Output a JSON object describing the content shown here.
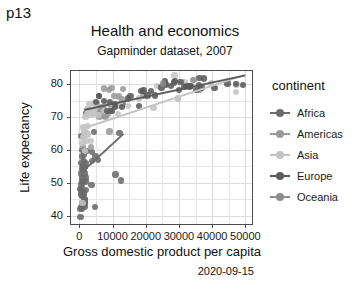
{
  "page": {
    "tag": "p13"
  },
  "chart_data": {
    "type": "scatter",
    "title": "Health and economics",
    "subtitle": "Gapminder dataset, 2007",
    "caption": "2020-09-15",
    "xlabel": "Gross domestic product per capita",
    "ylabel": "Life expectancy",
    "xlim": [
      -2500,
      52000
    ],
    "ylim": [
      37.5,
      84
    ],
    "xticks": [
      "0",
      "10000",
      "20000",
      "30000",
      "40000",
      "50000"
    ],
    "xtick_values": [
      0,
      10000,
      20000,
      30000,
      40000,
      50000
    ],
    "yticks": [
      "40",
      "50",
      "60",
      "70",
      "80"
    ],
    "ytick_values": [
      40,
      50,
      60,
      70,
      80
    ],
    "grid": true,
    "legend": {
      "title": "continent",
      "position": "right",
      "entries": [
        {
          "label": "Africa",
          "color": "#6b6b6b"
        },
        {
          "label": "Americas",
          "color": "#9a9a9a"
        },
        {
          "label": "Asia",
          "color": "#c4c4c4"
        },
        {
          "label": "Europe",
          "color": "#5a5a5a"
        },
        {
          "label": "Oceania",
          "color": "#8c8c8c"
        }
      ]
    },
    "series": [
      {
        "name": "Africa",
        "color": "#6b6b6b",
        "trendline": {
          "x1": 600,
          "y1": 53.0,
          "x2": 13500,
          "y2": 65.0
        },
        "points": [
          [
            974,
            43.8
          ],
          [
            5937,
            76.4
          ],
          [
            6223,
            72.3
          ],
          [
            4797,
            42.7
          ],
          [
            1441,
            56.7
          ],
          [
            12570,
            50.7
          ],
          [
            1217,
            50.7
          ],
          [
            430,
            52.9
          ],
          [
            2042,
            50.4
          ],
          [
            706,
            49.6
          ],
          [
            1704,
            44.7
          ],
          [
            986,
            50.4
          ],
          [
            277,
            48.2
          ],
          [
            3632,
            49.3
          ],
          [
            1544,
            54.8
          ],
          [
            2082,
            71.3
          ],
          [
            2013,
            51.6
          ],
          [
            863,
            58.0
          ],
          [
            1598,
            52.9
          ],
          [
            1932,
            56.0
          ],
          [
            1441,
            46.9
          ],
          [
            3822,
            59.4
          ],
          [
            1327,
            58.6
          ],
          [
            942,
            60.0
          ],
          [
            579,
            56.0
          ],
          [
            1463,
            46.5
          ],
          [
            1569,
            42.6
          ],
          [
            414,
            39.6
          ],
          [
            12154,
            65.2
          ],
          [
            641,
            64.2
          ],
          [
            690,
            47.0
          ],
          [
            13206,
            73.9
          ],
          [
            752,
            42.1
          ],
          [
            926,
            42.6
          ],
          [
            4513,
            65.5
          ],
          [
            1271,
            54.1
          ],
          [
            469,
            42.6
          ],
          [
            823,
            51.5
          ],
          [
            4910,
            58.0
          ],
          [
            823,
            54.4
          ],
          [
            1569,
            43.5
          ],
          [
            1302,
            55.3
          ],
          [
            574,
            46.4
          ],
          [
            619,
            48.3
          ],
          [
            2280,
            59.6
          ],
          [
            5581,
            57.0
          ],
          [
            1107,
            47.5
          ],
          [
            10957,
            52.6
          ],
          [
            3820,
            56.7
          ],
          [
            1593,
            54.8
          ],
          [
            320,
            42.1
          ],
          [
            863,
            46.0
          ],
          [
            1598,
            45.0
          ],
          [
            2042,
            47.8
          ],
          [
            1544,
            44.0
          ]
        ]
      },
      {
        "name": "Americas",
        "color": "#9a9a9a",
        "trendline": null,
        "points": [
          [
            12779,
            75.3
          ],
          [
            9066,
            65.6
          ],
          [
            9646,
            72.4
          ],
          [
            13172,
            78.6
          ],
          [
            7007,
            72.9
          ],
          [
            9645,
            78.8
          ],
          [
            8948,
            78.3
          ],
          [
            6873,
            72.9
          ],
          [
            5728,
            71.0
          ],
          [
            5186,
            74.2
          ],
          [
            7320,
            70.3
          ],
          [
            3548,
            60.9
          ],
          [
            7914,
            70.2
          ],
          [
            7093,
            72.6
          ],
          [
            1045,
            60.9
          ],
          [
            6025,
            70.2
          ],
          [
            6873,
            72.0
          ],
          [
            11978,
            76.2
          ],
          [
            9809,
            71.8
          ],
          [
            4172,
            71.7
          ],
          [
            7408,
            78.7
          ],
          [
            7320,
            72.4
          ],
          [
            19329,
            76.4
          ],
          [
            36319,
            78.2
          ],
          [
            10611,
            76.4
          ],
          [
            11416,
            73.3
          ],
          [
            8948,
            74.0
          ],
          [
            8458,
            71.0
          ]
        ]
      },
      {
        "name": "Asia",
        "color": "#c4c4c4",
        "trendline": {
          "x1": 400,
          "y1": 66.5,
          "x2": 50000,
          "y2": 83.0
        },
        "points": [
          [
            974,
            43.8
          ],
          [
            29796,
            75.6
          ],
          [
            1391,
            64.1
          ],
          [
            1713,
            59.7
          ],
          [
            1857,
            70.0
          ],
          [
            3548,
            72.0
          ],
          [
            29796,
            75.6
          ],
          [
            47143,
            77.6
          ],
          [
            4959,
            72.9
          ],
          [
            1091,
            66.8
          ],
          [
            2452,
            71.0
          ],
          [
            3540,
            62.7
          ],
          [
            11606,
            71.0
          ],
          [
            4471,
            70.9
          ],
          [
            1593,
            65.5
          ],
          [
            2280,
            72.5
          ],
          [
            28718,
            82.6
          ],
          [
            22316,
            72.8
          ],
          [
            2280,
            62.7
          ],
          [
            8458,
            74.2
          ],
          [
            12451,
            73.4
          ],
          [
            2441,
            67.3
          ],
          [
            1091,
            63.8
          ],
          [
            3540,
            70.7
          ],
          [
            23348,
            79.4
          ],
          [
            4519,
            74.2
          ],
          [
            31656,
            80.7
          ],
          [
            12154,
            73.9
          ],
          [
            39725,
            80.2
          ],
          [
            47307,
            79.9
          ],
          [
            2082,
            65.5
          ],
          [
            5728,
            70.6
          ],
          [
            3095,
            74.0
          ],
          [
            944,
            62.1
          ],
          [
            4172,
            71.7
          ],
          [
            18008,
            75.6
          ],
          [
            7458,
            71.8
          ],
          [
            2605,
            72.2
          ],
          [
            14641,
            73.4
          ],
          [
            2452,
            64.7
          ]
        ]
      },
      {
        "name": "Europe",
        "color": "#5a5a5a",
        "trendline": {
          "x1": 1500,
          "y1": 72.0,
          "x2": 50000,
          "y2": 82.5
        },
        "points": [
          [
            5937,
            76.4
          ],
          [
            36126,
            79.8
          ],
          [
            33693,
            79.4
          ],
          [
            7446,
            74.9
          ],
          [
            10681,
            73.0
          ],
          [
            14619,
            75.7
          ],
          [
            22833,
            76.5
          ],
          [
            35278,
            78.3
          ],
          [
            33207,
            79.3
          ],
          [
            30470,
            80.7
          ],
          [
            32170,
            79.4
          ],
          [
            27538,
            79.4
          ],
          [
            18009,
            73.3
          ],
          [
            36181,
            81.8
          ],
          [
            40676,
            78.9
          ],
          [
            28570,
            80.5
          ],
          [
            9254,
            74.5
          ],
          [
            36798,
            79.0
          ],
          [
            25768,
            80.2
          ],
          [
            4981,
            74.5
          ],
          [
            9786,
            71.8
          ],
          [
            20510,
            76.5
          ],
          [
            10808,
            74.0
          ],
          [
            19328,
            78.1
          ],
          [
            18678,
            77.9
          ],
          [
            25768,
            80.9
          ],
          [
            28821,
            80.9
          ],
          [
            37506,
            81.7
          ],
          [
            8458,
            71.8
          ],
          [
            33203,
            79.4
          ],
          [
            49357,
            79.8
          ],
          [
            44614,
            80.2
          ],
          [
            47143,
            80.0
          ],
          [
            26074,
            79.9
          ],
          [
            21654,
            78.0
          ],
          [
            15389,
            76.4
          ],
          [
            30035,
            78.3
          ],
          [
            31655,
            79.1
          ],
          [
            24768,
            79.0
          ],
          [
            12779,
            73.0
          ]
        ]
      },
      {
        "name": "Oceania",
        "color": "#8c8c8c",
        "trendline": null,
        "points": [
          [
            34435,
            81.2
          ],
          [
            25185,
            80.2
          ]
        ]
      }
    ]
  }
}
